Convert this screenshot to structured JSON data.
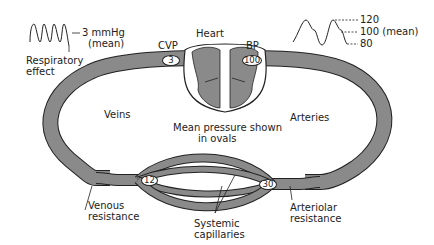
{
  "diagram": {
    "heart_label": "Heart",
    "cvp_label": "CVP",
    "bp_label": "BP",
    "cvp_value": "3",
    "bp_value": "100",
    "venous_resistance_value": "12",
    "arteriolar_resistance_value": "30",
    "veins_label": "Veins",
    "arteries_label": "Arteries",
    "center_note_line1": "Mean pressure shown",
    "center_note_line2": "in ovals",
    "venous_resistance_line1": "Venous",
    "venous_resistance_line2": "resistance",
    "arteriolar_resistance_line1": "Arteriolar",
    "arteriolar_resistance_line2": "resistance",
    "capillaries_line1": "Systemic",
    "capillaries_line2": "capillaries"
  },
  "venous_waveform": {
    "value_label": "3 mmHg",
    "mean_label": "(mean)",
    "caption_line1": "Respiratory",
    "caption_line2": "effect"
  },
  "arterial_waveform": {
    "systolic": "120",
    "mean": "100 (mean)",
    "diastolic": "80"
  },
  "colors": {
    "vessel_fill": "#8a8a8a",
    "outline": "#222222",
    "background": "#ffffff"
  }
}
